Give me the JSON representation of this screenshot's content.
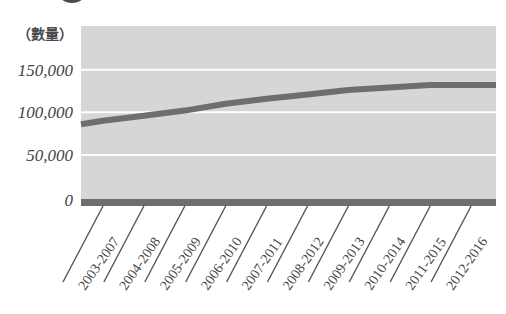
{
  "chart_data": {
    "type": "line",
    "title": "",
    "xlabel": "",
    "ylabel": "（數量）",
    "categories": [
      "2003-2007",
      "2004-2008",
      "2005-2009",
      "2006-2010",
      "2007-2011",
      "2008-2012",
      "2009-2013",
      "2010-2014",
      "2011-2015",
      "2012-2016"
    ],
    "series": [
      {
        "name": "數量",
        "values": [
          90000,
          96000,
          102000,
          110000,
          116000,
          121000,
          126000,
          129000,
          132000,
          132000
        ]
      }
    ],
    "line_start_value": 86000,
    "line_end_value": 132000,
    "yticks": [
      0,
      50000,
      100000,
      150000
    ],
    "ytick_labels": [
      "0",
      "50,000",
      "100,000",
      "150,000"
    ],
    "ylim": [
      0,
      175000
    ],
    "grid": true,
    "legend": null,
    "colors": {
      "plot_background": "#d6d6d6",
      "gridline": "#ffffff",
      "line": "#6e6e6e",
      "baseline_bar": "#6e6e6e",
      "tick_text": "#444444"
    }
  }
}
